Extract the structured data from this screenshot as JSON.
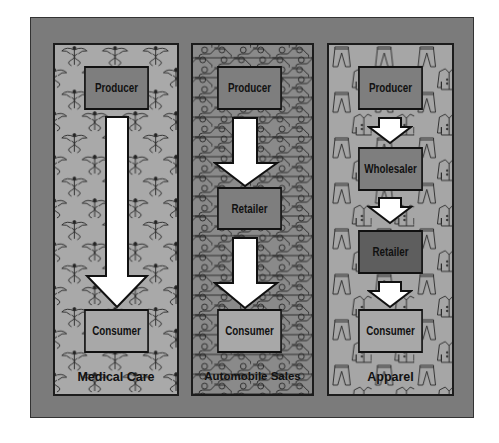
{
  "diagram": {
    "colors": {
      "frame": "#7b7b7b",
      "medical_bg": "#a9a9a9",
      "auto_bg": "#8a8a8a",
      "apparel_bg": "#a6a6a6",
      "box_dark": "#7e7e7e",
      "box_light": "#a8a8a8",
      "box_darkest": "#5e5e5e",
      "arrow": "#ffffff"
    },
    "columns": [
      {
        "id": "medical",
        "label": "Medical Care",
        "pattern_icon": "caduceus-icon",
        "nodes": [
          {
            "label": "Producer"
          },
          {
            "label": "Consumer"
          }
        ]
      },
      {
        "id": "automobile",
        "label": "Automobile Sales",
        "pattern_icon": "car-icon",
        "nodes": [
          {
            "label": "Producer"
          },
          {
            "label": "Retailer"
          },
          {
            "label": "Consumer"
          }
        ]
      },
      {
        "id": "apparel",
        "label": "Apparel",
        "pattern_icon": "clothing-icon",
        "nodes": [
          {
            "label": "Producer"
          },
          {
            "label": "Wholesaler"
          },
          {
            "label": "Retailer"
          },
          {
            "label": "Consumer"
          }
        ]
      }
    ]
  }
}
